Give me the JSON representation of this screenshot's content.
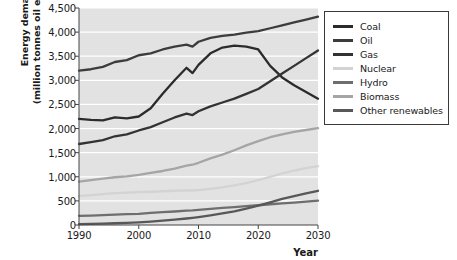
{
  "chart_data": {
    "type": "line",
    "title": "",
    "xlabel": "Year",
    "ylabel": "Energy demand (million tonnes oil equivalent)",
    "ylabel_line1": "Energy demand",
    "ylabel_line2": "(million tonnes oil equivalent)",
    "xlim": [
      1990,
      2030
    ],
    "ylim": [
      0,
      4500
    ],
    "grid": true,
    "legend_position": "right-outside",
    "plot_bgcolor": "#e2e2e2",
    "gridline_color": "#ffffff",
    "xticks": [
      "1990",
      "2000",
      "2010",
      "2020",
      "2030"
    ],
    "xtick_values": [
      1990,
      2000,
      2010,
      2020,
      2030
    ],
    "yticks": [
      "0",
      "500",
      "1,000",
      "1,500",
      "2,000",
      "2,500",
      "3,000",
      "3,500",
      "4,000",
      "4,500"
    ],
    "ytick_values": [
      0,
      500,
      1000,
      1500,
      2000,
      2500,
      3000,
      3500,
      4000,
      4500
    ],
    "x": [
      1990,
      1992,
      1994,
      1996,
      1998,
      2000,
      2002,
      2004,
      2006,
      2008,
      2009,
      2010,
      2012,
      2014,
      2016,
      2018,
      2020,
      2022,
      2024,
      2026,
      2028,
      2030
    ],
    "series": [
      {
        "name": "Coal",
        "color": "#2b2b2b",
        "values": [
          2200,
          2180,
          2170,
          2230,
          2210,
          2250,
          2420,
          2720,
          3000,
          3260,
          3150,
          3320,
          3560,
          3680,
          3720,
          3700,
          3640,
          3300,
          3060,
          2900,
          2760,
          2620
        ]
      },
      {
        "name": "Oil",
        "color": "#3c3c3c",
        "values": [
          3200,
          3230,
          3280,
          3380,
          3420,
          3520,
          3560,
          3640,
          3700,
          3740,
          3700,
          3800,
          3880,
          3920,
          3950,
          3990,
          4020,
          4080,
          4140,
          4200,
          4260,
          4320
        ]
      },
      {
        "name": "Gas",
        "color": "#333333",
        "values": [
          1680,
          1720,
          1760,
          1840,
          1880,
          1960,
          2030,
          2130,
          2230,
          2310,
          2280,
          2360,
          2460,
          2540,
          2620,
          2720,
          2820,
          2980,
          3140,
          3300,
          3460,
          3620
        ]
      },
      {
        "name": "Nuclear",
        "color": "#d3d3d3",
        "values": [
          600,
          620,
          640,
          660,
          670,
          680,
          690,
          700,
          710,
          720,
          715,
          725,
          750,
          780,
          820,
          870,
          930,
          1000,
          1070,
          1130,
          1180,
          1220
        ]
      },
      {
        "name": "Hydro",
        "color": "#6e6e6e",
        "values": [
          190,
          195,
          205,
          215,
          225,
          230,
          250,
          265,
          280,
          300,
          305,
          315,
          335,
          355,
          370,
          390,
          410,
          430,
          450,
          465,
          485,
          505
        ]
      },
      {
        "name": "Biomass",
        "color": "#a5a5a5",
        "values": [
          900,
          930,
          960,
          990,
          1010,
          1040,
          1080,
          1120,
          1170,
          1230,
          1250,
          1290,
          1380,
          1460,
          1550,
          1650,
          1740,
          1820,
          1880,
          1930,
          1970,
          2010
        ]
      },
      {
        "name": "Other renewables",
        "color": "#585858",
        "values": [
          20,
          25,
          30,
          36,
          44,
          55,
          70,
          90,
          110,
          135,
          150,
          165,
          200,
          240,
          285,
          340,
          400,
          470,
          540,
          600,
          655,
          710
        ]
      }
    ]
  },
  "legend": {
    "items": [
      {
        "label": "Coal",
        "color": "#2b2b2b"
      },
      {
        "label": "Oil",
        "color": "#3c3c3c"
      },
      {
        "label": "Gas",
        "color": "#333333"
      },
      {
        "label": "Nuclear",
        "color": "#d3d3d3"
      },
      {
        "label": "Hydro",
        "color": "#6e6e6e"
      },
      {
        "label": "Biomass",
        "color": "#a5a5a5"
      },
      {
        "label": "Other renewables",
        "color": "#585858"
      }
    ]
  }
}
